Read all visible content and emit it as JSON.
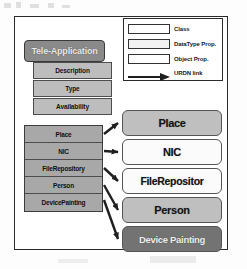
{
  "diagram": {
    "main_class": {
      "name": "Tele-Application"
    },
    "datatype_properties": [
      {
        "label": "Description"
      },
      {
        "label": "Type"
      },
      {
        "label": "Availability"
      }
    ],
    "object_properties": [
      {
        "label": "Place"
      },
      {
        "label": "NIC"
      },
      {
        "label": "FileRepository"
      },
      {
        "label": "Person"
      },
      {
        "label": "DevicePainting"
      }
    ],
    "target_classes": [
      {
        "label": "Place",
        "fill": "#bfbfbf"
      },
      {
        "label": "NIC",
        "fill": "#fbfbfb"
      },
      {
        "label": "FileRepositor",
        "fill": "#fbfbfb"
      },
      {
        "label": "Person",
        "fill": "#bfbfbf"
      },
      {
        "label": "Device Painting",
        "fill": "#737373"
      }
    ],
    "legend": {
      "items": [
        {
          "label": "Class",
          "swatch": "class-swatch"
        },
        {
          "label": "DataType Prop.",
          "swatch": "datatype-swatch"
        },
        {
          "label": "Object Prop.",
          "swatch": "object-swatch"
        },
        {
          "label": "URDN link",
          "swatch": "arrow-swatch"
        }
      ]
    },
    "colors": {
      "header_fill": "#8a8a8a",
      "datatype_fill": "#bdbdbd",
      "object_fill": "#a8a8a8",
      "target_gray": "#bfbfbf",
      "target_white": "#fbfbfb",
      "target_dark": "#737373",
      "outline": "#2b2b2b",
      "arrow": "#1f1f1f"
    }
  }
}
